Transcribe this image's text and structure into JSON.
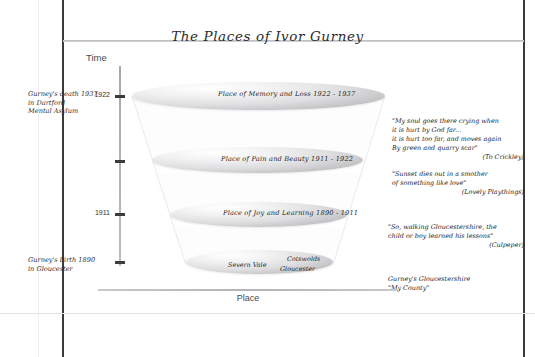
{
  "title": "The Places of Ivor Gurney",
  "axes": {
    "time": {
      "label": "Time",
      "ticks": [
        {
          "year": "1937",
          "note": "Gurney's death 1937\nin Dartford\nMental Asylum"
        },
        {
          "year": "1922",
          "note": ""
        },
        {
          "year": "1911",
          "note": ""
        },
        {
          "year": "1890",
          "note": "Gurney's birth 1890\nin Gloucester"
        }
      ]
    },
    "place": {
      "label": "Place"
    }
  },
  "funnel": {
    "stages": [
      {
        "label": "Place of Memory and Loss 1922 - 1937"
      },
      {
        "label": "Place of Pain and Beauty 1911 - 1922"
      },
      {
        "label": "Place of Joy and Learning 1890 - 1911"
      }
    ],
    "base_places": [
      {
        "name": "Severn Vale"
      },
      {
        "name": "Cotswolds"
      },
      {
        "name": "Gloucester"
      }
    ]
  },
  "annotations": [
    {
      "text": "\"My soul goes there crying when\nit is hurt by God far...\nit is hurt too far, and moves again\nBy green and quarry scar\"",
      "attrib": "(To Crickley)"
    },
    {
      "text": "\"Sunset dies out in a smother\nof something like love\"",
      "attrib": "(Lovely Playthings)"
    },
    {
      "text": "\"So, walking Gloucestershire, the\nchild or boy learned his lessons\"",
      "attrib": "(Culpeper)"
    },
    {
      "text": "Gurney's Gloucestershire\n\"My County\"",
      "attrib": ""
    }
  ]
}
